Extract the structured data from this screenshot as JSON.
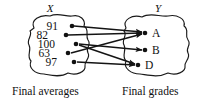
{
  "figure": {
    "type": "function-mapping-diagram",
    "width": 205,
    "height": 101,
    "background": "#ffffff",
    "ink_color": "#111111"
  },
  "domain_set": {
    "label": "X",
    "caption": "Final averages",
    "elements": [
      {
        "value": "91",
        "dot_x": 72,
        "dot_y": 26,
        "label_x": 58,
        "label_y": 30
      },
      {
        "value": "82",
        "dot_x": 66,
        "dot_y": 35,
        "label_x": 48,
        "label_y": 39
      },
      {
        "value": "100",
        "dot_x": 76,
        "dot_y": 44,
        "label_x": 55,
        "label_y": 48
      },
      {
        "value": "63",
        "dot_x": 68,
        "dot_y": 53,
        "label_x": 50,
        "label_y": 57
      },
      {
        "value": "97",
        "dot_x": 74,
        "dot_y": 62,
        "label_x": 57,
        "label_y": 66
      }
    ]
  },
  "codomain_set": {
    "label": "Y",
    "caption": "Final grades",
    "elements": [
      {
        "value": "A",
        "dot_x": 145,
        "dot_y": 33,
        "label_x": 152,
        "label_y": 37
      },
      {
        "value": "B",
        "dot_x": 145,
        "dot_y": 50,
        "label_x": 152,
        "label_y": 54
      },
      {
        "value": "D",
        "dot_x": 138,
        "dot_y": 65,
        "label_x": 145,
        "label_y": 69
      }
    ]
  },
  "mappings": [
    {
      "from": "91",
      "to": "A",
      "x1": 74,
      "y1": 26,
      "x2": 142,
      "y2": 32
    },
    {
      "from": "82",
      "to": "A",
      "x1": 68,
      "y1": 35,
      "x2": 142,
      "y2": 33
    },
    {
      "from": "100",
      "to": "B",
      "x1": 79,
      "y1": 44,
      "x2": 142,
      "y2": 50
    },
    {
      "from": "63",
      "to": "A",
      "x1": 71,
      "y1": 53,
      "x2": 142,
      "y2": 34
    },
    {
      "from": "97",
      "to": "D",
      "x1": 77,
      "y1": 62,
      "x2": 135,
      "y2": 65
    },
    {
      "from": "100",
      "to": "D",
      "x1": 79,
      "y1": 45,
      "x2": 135,
      "y2": 64
    }
  ],
  "blobs": {
    "left_outline": "M 34 28 C 30 20, 40 14, 50 16 C 58 12, 66 17, 72 16 C 80 14, 86 20, 84 26 C 90 30, 85 35, 88 40 C 92 45, 85 48, 88 53 C 91 58, 84 61, 85 66 C 86 72, 76 76, 68 73 C 60 78, 50 75, 44 74 C 35 74, 28 68, 31 61 C 26 56, 32 50, 29 45 C 26 40, 33 35, 30 31 Z",
    "right_outline": "M 126 28 C 122 20, 132 14, 142 17 C 150 12, 160 17, 168 16 C 177 14, 186 19, 184 26 C 190 30, 184 35, 188 40 C 192 45, 185 48, 188 53 C 191 58, 184 62, 185 66 C 186 72, 176 76, 168 73 C 158 78, 148 75, 140 74 C 131 74, 123 68, 126 61 C 121 56, 127 50, 124 45 C 121 40, 128 35, 124 31 Z"
  },
  "captions": {
    "left": {
      "text": "Final averages",
      "x": 12,
      "y": 95
    },
    "right": {
      "text": "Final grades",
      "x": 122,
      "y": 95
    }
  },
  "set_labels": {
    "left": {
      "text": "X",
      "x": 50,
      "y": 12
    },
    "right": {
      "text": "Y",
      "x": 158,
      "y": 12
    }
  }
}
